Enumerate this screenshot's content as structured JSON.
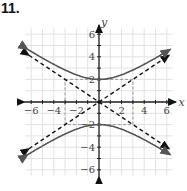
{
  "problem_number": "11.",
  "chart_data": {
    "type": "line",
    "title": "",
    "xlabel": "x",
    "ylabel": "y",
    "xlim": [
      -6.5,
      6.5
    ],
    "ylim": [
      -6.5,
      6.5
    ],
    "grid": true,
    "x_ticks": [
      -6,
      -4,
      -2,
      2,
      4,
      6
    ],
    "y_ticks": [
      6,
      4,
      2,
      -2,
      -4,
      -6
    ],
    "x_tick_labels": [
      "−6",
      "−4",
      "−2",
      "2",
      "4",
      "6"
    ],
    "y_tick_labels": [
      "6",
      "4",
      "2",
      "−2",
      "−4",
      "−6"
    ],
    "equation": "y^2/4 - x^2/9 = 1",
    "series": [
      {
        "name": "hyperbola upper branch",
        "style": "solid",
        "color": "#555555",
        "vertex": [
          0,
          2
        ]
      },
      {
        "name": "hyperbola lower branch",
        "style": "solid",
        "color": "#555555",
        "vertex": [
          0,
          -2
        ]
      },
      {
        "name": "asymptote y = 2x/3",
        "style": "dashed",
        "color": "#111111",
        "slope": 0.6667
      },
      {
        "name": "asymptote y = -2x/3",
        "style": "dashed",
        "color": "#111111",
        "slope": -0.6667
      },
      {
        "name": "fundamental rectangle",
        "style": "dashed",
        "color": "#888888",
        "corners": [
          [
            -3,
            2
          ],
          [
            3,
            2
          ],
          [
            3,
            -2
          ],
          [
            -3,
            -2
          ]
        ]
      }
    ]
  }
}
